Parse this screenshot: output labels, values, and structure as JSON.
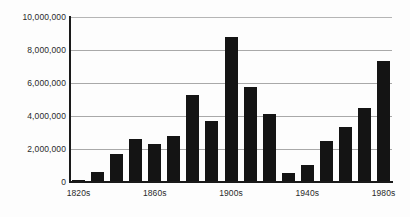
{
  "chart_data": {
    "type": "bar",
    "title": "",
    "subtitle": "",
    "xlabel": "",
    "ylabel": "",
    "ylim": [
      0,
      10000000
    ],
    "grid": true,
    "legend": "none",
    "bar_color": "#141414",
    "axis_color": "#1a1a1a",
    "gridline_color": "#a9a9a9",
    "categories": [
      "1820s",
      "1830s",
      "1840s",
      "1850s",
      "1860s",
      "1870s",
      "1880s",
      "1890s",
      "1900s",
      "1910s",
      "1920s",
      "1930s",
      "1940s",
      "1950s",
      "1960s",
      "1970s",
      "1980s"
    ],
    "values": [
      150000,
      600000,
      1700000,
      2600000,
      2300000,
      2800000,
      5250000,
      3700000,
      8800000,
      5750000,
      4120000,
      530000,
      1035000,
      2515000,
      3320000,
      4490000,
      7340000
    ],
    "y_ticks": [
      {
        "value": 0,
        "label": "0"
      },
      {
        "value": 2000000,
        "label": "2,000,000"
      },
      {
        "value": 4000000,
        "label": "4,000,000"
      },
      {
        "value": 6000000,
        "label": "6,000,000"
      },
      {
        "value": 8000000,
        "label": "8,000,000"
      },
      {
        "value": 10000000,
        "label": "10,000,000"
      }
    ],
    "x_ticks": [
      {
        "index": 0,
        "label": "1820s"
      },
      {
        "index": 4,
        "label": "1860s"
      },
      {
        "index": 8,
        "label": "1900s"
      },
      {
        "index": 12,
        "label": "1940s"
      },
      {
        "index": 16,
        "label": "1980s"
      }
    ]
  }
}
